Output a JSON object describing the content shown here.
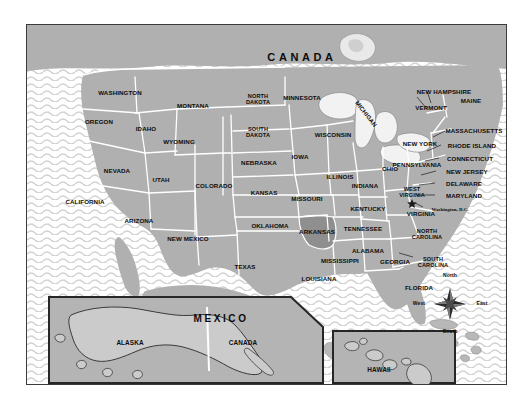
{
  "map": {
    "title_canada": "CANADA",
    "title_mexico": "MEXICO",
    "highlight_state": "ARKANSAS",
    "highlight_color": "#8f8f8f",
    "land_color": "#b0b0b0",
    "ocean_color": "#ffffff",
    "wave_color": "#cfcfcf",
    "border_color": "#ffffff",
    "frame_color": "#3b3b3b",
    "label_color": "#0d0d0d"
  },
  "states": [
    {
      "name": "WASHINGTON",
      "x": 93,
      "y": 68
    },
    {
      "name": "OREGON",
      "x": 72,
      "y": 97
    },
    {
      "name": "IDAHO",
      "x": 119,
      "y": 104
    },
    {
      "name": "MONTANA",
      "x": 166,
      "y": 81
    },
    {
      "name": "WYOMING",
      "x": 152,
      "y": 117
    },
    {
      "name": "NEVADA",
      "x": 90,
      "y": 146
    },
    {
      "name": "UTAH",
      "x": 134,
      "y": 155
    },
    {
      "name": "CALIFORNIA",
      "x": 58,
      "y": 177
    },
    {
      "name": "ARIZONA",
      "x": 112,
      "y": 196
    },
    {
      "name": "NEW MEXICO",
      "x": 161,
      "y": 214
    },
    {
      "name": "COLORADO",
      "x": 187,
      "y": 161
    },
    {
      "name": "NORTH\nDAKOTA",
      "x": 231,
      "y": 75
    },
    {
      "name": "SOUTH\nDAKOTA",
      "x": 231,
      "y": 108
    },
    {
      "name": "NEBRASKA",
      "x": 232,
      "y": 138
    },
    {
      "name": "KANSAS",
      "x": 237,
      "y": 168
    },
    {
      "name": "OKLAHOMA",
      "x": 243,
      "y": 201
    },
    {
      "name": "TEXAS",
      "x": 218,
      "y": 242
    },
    {
      "name": "MINNESOTA",
      "x": 275,
      "y": 73
    },
    {
      "name": "IOWA",
      "x": 273,
      "y": 132
    },
    {
      "name": "MISSOURI",
      "x": 280,
      "y": 174
    },
    {
      "name": "ARKANSAS",
      "x": 290,
      "y": 207
    },
    {
      "name": "LOUISIANA",
      "x": 292,
      "y": 254
    },
    {
      "name": "WISCONSIN",
      "x": 306,
      "y": 110
    },
    {
      "name": "ILLINOIS",
      "x": 313,
      "y": 152
    },
    {
      "name": "MISSISSIPPI",
      "x": 313,
      "y": 236
    },
    {
      "name": "MICHIGAN",
      "x": 339,
      "y": 89
    },
    {
      "name": "INDIANA",
      "x": 338,
      "y": 161
    },
    {
      "name": "KENTUCKY",
      "x": 341,
      "y": 184
    },
    {
      "name": "TENNESSEE",
      "x": 336,
      "y": 204
    },
    {
      "name": "ALABAMA",
      "x": 341,
      "y": 226
    },
    {
      "name": "OHIO",
      "x": 363,
      "y": 144
    },
    {
      "name": "GEORGIA",
      "x": 368,
      "y": 237
    },
    {
      "name": "FLORIDA",
      "x": 392,
      "y": 263
    },
    {
      "name": "WEST\nVIRGINIA",
      "x": 385,
      "y": 168
    },
    {
      "name": "VIRGINIA",
      "x": 394,
      "y": 189
    },
    {
      "name": "NORTH\nCAROLINA",
      "x": 400,
      "y": 210
    },
    {
      "name": "SOUTH\nCAROLINA",
      "x": 406,
      "y": 238
    },
    {
      "name": "PENNSYLVANIA",
      "x": 390,
      "y": 140
    },
    {
      "name": "NEW YORK",
      "x": 393,
      "y": 119
    },
    {
      "name": "VERMONT",
      "x": 404,
      "y": 83
    },
    {
      "name": "NEW HAMPSHIRE",
      "x": 417,
      "y": 67
    },
    {
      "name": "MAINE",
      "x": 444,
      "y": 76
    }
  ],
  "callouts": [
    {
      "name": "MASSACHUSETTS",
      "x": 447,
      "y": 106
    },
    {
      "name": "RHODE ISLAND",
      "x": 445,
      "y": 121
    },
    {
      "name": "CONNECTICUT",
      "x": 443,
      "y": 134
    },
    {
      "name": "NEW JERSEY",
      "x": 440,
      "y": 147
    },
    {
      "name": "DELAWARE",
      "x": 437,
      "y": 159
    },
    {
      "name": "MARYLAND",
      "x": 437,
      "y": 171
    }
  ],
  "capital": {
    "label": "Washington, D.C.",
    "x": 423,
    "y": 184,
    "marker_x": 385,
    "marker_y": 177
  },
  "insets": [
    {
      "id": "alaska",
      "labels": [
        "ALASKA",
        "CANADA"
      ]
    },
    {
      "id": "hawaii",
      "labels": [
        "HAWAII"
      ]
    }
  ],
  "inset_labels": {
    "alaska": "ALASKA",
    "alaska_canada": "CANADA",
    "hawaii": "HAWAII"
  },
  "compass": {
    "north": "North",
    "south": "South",
    "east": "East",
    "west": "West",
    "cx": 423,
    "cy": 279
  }
}
